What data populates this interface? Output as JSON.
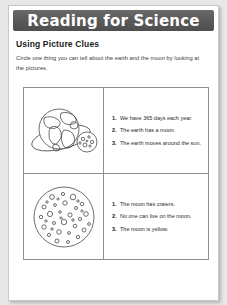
{
  "banner": {
    "title": "Reading for Science",
    "background_color": "#5b5b5b",
    "text_color": "#ffffff"
  },
  "worksheet": {
    "section_title": "Using Picture Clues",
    "instructions": "Circle one thing you can tell about the earth and the moon by looking at the pictures.",
    "rows": [
      {
        "illustration": "earth-with-moon-and-orbit",
        "statements": [
          "We have 365 days each year.",
          "The earth has a moon.",
          "The earth moves around the sun."
        ]
      },
      {
        "illustration": "cratered-moon",
        "statements": [
          "The moon has craters.",
          "No one can live on the moon.",
          "The moon is yellow."
        ]
      }
    ]
  },
  "page": {
    "background_color": "#ffffff",
    "border_color": "#c9c9c9"
  }
}
